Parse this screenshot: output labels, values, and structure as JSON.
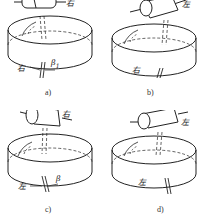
{
  "figure": {
    "panels": [
      {
        "id": "a",
        "caption": "a)",
        "worm_hand": "右",
        "wheel_hand": "右",
        "angle": "β",
        "angle_sub": "1"
      },
      {
        "id": "b",
        "caption": "b)",
        "worm_hand": "左",
        "wheel_hand": "右",
        "angle": "",
        "angle_sub": ""
      },
      {
        "id": "c",
        "caption": "c)",
        "worm_hand": "右",
        "wheel_hand": "左",
        "angle": "β",
        "angle_sub": ""
      },
      {
        "id": "d",
        "caption": "d)",
        "worm_hand": "左",
        "wheel_hand": "左",
        "angle": "",
        "angle_sub": ""
      }
    ],
    "colors": {
      "line": "#222222",
      "background": "#ffffff"
    }
  }
}
